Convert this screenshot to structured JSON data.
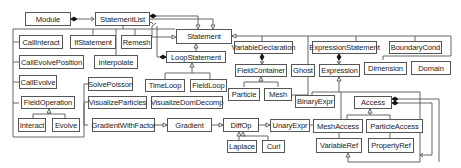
{
  "diagram": {
    "type": "uml-class-diagram",
    "classes": {
      "module": "Module",
      "statement_list": "StatementList",
      "statement": "Statement",
      "variable_declaration": "VariableDeclaration",
      "expression_statement": "ExpressionStatement",
      "boundary_cond": "BoundaryCond",
      "call_interact": "CallInteract",
      "if_statement": "IfStatement",
      "remesh": "Remesh",
      "loop_statement": "LoopStatement",
      "call_evolve_position": "CallEvolvePosition",
      "interpolate": "Interpolate",
      "call_evolve": "CallEvolve",
      "solve_poisson": "SolvePoisson",
      "time_loop": "TimeLoop",
      "field_loop": "FieldLoop",
      "field_container": "FieldContainer",
      "ghost": "Ghost",
      "expression": "Expression",
      "dimension": "Dimension",
      "domain": "Domain",
      "field_operation": "FieldOperation",
      "visualize_particles": "VisualizeParticles",
      "visualize_dom_decomp": "VisualizeDomDecomp",
      "particle": "Particle",
      "mesh": "Mesh",
      "binary_expr": "BinaryExpr",
      "access": "Access",
      "interact": "Interact",
      "evolve": "Evolve",
      "gradient_with_factor": "GradientWithFactor",
      "gradient": "Gradient",
      "diff_op": "DiffOp",
      "unary_expr": "UnaryExpr",
      "mesh_access": "MeshAccess",
      "particle_access": "ParticleAccess",
      "laplace": "Laplace",
      "curl": "Curl",
      "variable_ref": "VariableRef",
      "property_ref": "PropertyRef"
    },
    "colors": {
      "line": "#555555",
      "box_border": "#555555",
      "text": "#222222",
      "background": "#ffffff"
    }
  }
}
